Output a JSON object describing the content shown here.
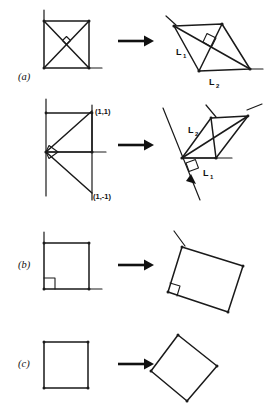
{
  "figure": {
    "background_color": "#ffffff",
    "ink_color": "#1a1a1a",
    "width": 267,
    "height": 415,
    "panel_labels": [
      {
        "id": "a",
        "text": "(a)",
        "x": 18,
        "y": 76
      },
      {
        "id": "b",
        "text": "(b)",
        "x": 18,
        "y": 264
      },
      {
        "id": "c",
        "text": "(c)",
        "x": 18,
        "y": 363
      }
    ],
    "arrows": [
      {
        "id": "arrow-row1",
        "x1": 118,
        "y1": 41,
        "x2": 152,
        "y2": 41
      },
      {
        "id": "arrow-row2",
        "x1": 118,
        "y1": 145,
        "x2": 152,
        "y2": 145
      },
      {
        "id": "arrow-row3",
        "x1": 118,
        "y1": 265,
        "x2": 152,
        "y2": 265
      },
      {
        "id": "arrow-row4",
        "x1": 118,
        "y1": 364,
        "x2": 152,
        "y2": 364
      }
    ],
    "rows": [
      {
        "id": "row-1-square-with-diagonals",
        "panel": "a",
        "source": {
          "id": "source-square-diagonals",
          "shape": "square",
          "vertices": [
            [
              44,
              21
            ],
            [
              89,
              21
            ],
            [
              89,
              68
            ],
            [
              44,
              68
            ]
          ],
          "diagonals": true,
          "right_angle_marker": true,
          "axis_ticks": [
            "vertical-up-at-top-left",
            "horizontal-right-at-bottom-right"
          ]
        },
        "target": {
          "id": "target-parallelogram-diagonals",
          "shape": "parallelogram",
          "vertices": [
            [
              174,
              26
            ],
            [
              222,
              24
            ],
            [
              250,
              69
            ],
            [
              199,
              71
            ]
          ],
          "diagonals": true,
          "right_angle_marker": true,
          "labels": [
            {
              "base": "L",
              "sub": "1",
              "x": 180,
              "y": 52
            },
            {
              "base": "L",
              "sub": "2",
              "x": 212,
              "y": 82
            }
          ]
        }
      },
      {
        "id": "row-2-triangle-pair",
        "panel": "a",
        "source": {
          "id": "source-right-triangle-pair",
          "shape": "two-right-triangles",
          "origin": [
            46,
            152
          ],
          "corner_points": [
            {
              "label": "(1,1)",
              "x": 92,
              "y": 110,
              "text_x": 95,
              "text_y": 112
            },
            {
              "label": "(1,-1)",
              "x": 92,
              "y": 192,
              "text_x": 93,
              "text_y": 199
            }
          ],
          "right_angle_marker": true,
          "axis_ticks": [
            "vertical-up-at-top-left",
            "horizontal-right-at-origin"
          ]
        },
        "target": {
          "id": "target-sheared-triangle-pair",
          "shape": "two-sheared-triangles",
          "origin": [
            182,
            158
          ],
          "right_angle_marker": true,
          "labels": [
            {
              "base": "L",
              "sub": "2",
              "x": 191,
              "y": 130
            },
            {
              "base": "L",
              "sub": "1",
              "x": 206,
              "y": 172
            }
          ]
        }
      },
      {
        "id": "row-3-square-right-angle",
        "panel": "b",
        "source": {
          "id": "source-square-right-angle",
          "shape": "square",
          "vertices": [
            [
              44,
              243
            ],
            [
              89,
              243
            ],
            [
              89,
              289
            ],
            [
              44,
              289
            ]
          ],
          "diagonals": false,
          "right_angle_marker": true,
          "axis_ticks": [
            "vertical-up-at-top-left",
            "horizontal-right-at-bottom-right"
          ]
        },
        "target": {
          "id": "target-rotated-rectangle",
          "shape": "rotated-rectangle",
          "vertices": [
            [
              182,
              243
            ],
            [
              243,
              262
            ],
            [
              228,
              311
            ],
            [
              168,
              291
            ]
          ],
          "diagonals": false,
          "right_angle_marker": true,
          "axis_ticks": [
            "tilted-through-top-left"
          ]
        }
      },
      {
        "id": "row-4-plain-square",
        "panel": "c",
        "source": {
          "id": "source-plain-square",
          "shape": "square",
          "vertices": [
            [
              44,
              342
            ],
            [
              88,
              342
            ],
            [
              88,
              388
            ],
            [
              44,
              388
            ]
          ],
          "diagonals": false,
          "right_angle_marker": false,
          "axis_ticks": []
        },
        "target": {
          "id": "target-rotated-square",
          "shape": "rotated-square",
          "vertices": [
            [
              178,
              335
            ],
            [
              217,
              366
            ],
            [
              187,
              400
            ],
            [
              151,
              371
            ]
          ],
          "diagonals": false,
          "right_angle_marker": false,
          "axis_ticks": []
        }
      }
    ]
  }
}
